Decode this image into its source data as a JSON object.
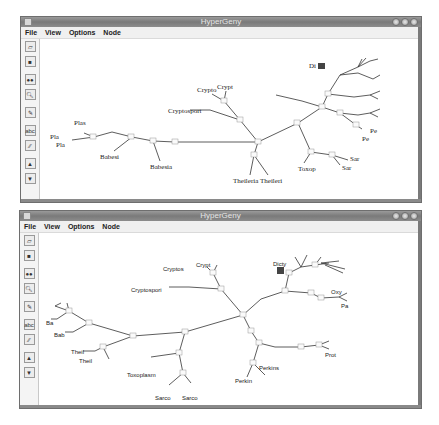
{
  "windows": [
    {
      "title": "HyperGeny",
      "menu": [
        "File",
        "View",
        "Options",
        "Node"
      ],
      "toolbar": [
        "open-icon",
        "save-icon",
        "find-icon",
        "preview-icon",
        "edit-icon",
        "abc-icon",
        "link-icon",
        "up-icon",
        "down-icon"
      ],
      "labels": {
        "crypto": "Crypto",
        "crypt": "Crypt",
        "cryptosport": "Cryptosport",
        "di": "Di",
        "pe1": "Pe",
        "pe2": "Pe",
        "plas": "Plas",
        "pla1": "Pla",
        "pla2": "Pla",
        "babesi": "Babesi",
        "babesia": "Babesia",
        "theileria": "Theileria",
        "theileri": "Theileri",
        "toxop": "Toxop",
        "sar1": "Sar",
        "sar2": "Sar"
      }
    },
    {
      "title": "HyperGeny",
      "menu": [
        "File",
        "View",
        "Options",
        "Node"
      ],
      "toolbar": [
        "open-icon",
        "save-icon",
        "find-icon",
        "preview-icon",
        "edit-icon",
        "abc-icon",
        "link-icon",
        "up-icon",
        "down-icon"
      ],
      "labels": {
        "cryptos": "Cryptos",
        "crypt": "Crypt",
        "cryptospori": "Cryptospori",
        "dicty": "Dicty",
        "oxy": "Oxy",
        "pa": "Pa",
        "ba": "Ba",
        "bab": "Bab",
        "theil1": "Theil",
        "theil2": "Theil",
        "toxoplasm": "Toxoplasm",
        "sarco1": "Sarco",
        "sarco2": "Sarco",
        "prot": "Prot",
        "perkin": "Perkin",
        "perkins": "Perkins"
      }
    }
  ]
}
